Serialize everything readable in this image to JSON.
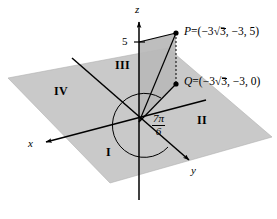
{
  "figure": {
    "type": "3d-coordinate-diagram",
    "background_color": "#ffffff",
    "plane_fill_color": "#c8c8c8",
    "wall_fill_color": "#b4b4b4",
    "line_color": "#000000",
    "axes": [
      {
        "name": "x",
        "label": "x"
      },
      {
        "name": "y",
        "label": "y"
      },
      {
        "name": "z",
        "label": "z"
      }
    ],
    "ticks": [
      {
        "axis": "z",
        "label": "5",
        "value": 5
      }
    ],
    "quadrants": [
      {
        "name": "quadrant-one",
        "label": "I"
      },
      {
        "name": "quadrant-two",
        "label": "II"
      },
      {
        "name": "quadrant-three",
        "label": "III"
      },
      {
        "name": "quadrant-four",
        "label": "IV"
      }
    ],
    "points": [
      {
        "name": "point-p",
        "label_name": "P",
        "equals": "=",
        "open_paren": "(",
        "coord_x_prefix": "−3",
        "coord_x_radical": "3",
        "coord_y": ", −3, ",
        "coord_z": "5",
        "close_paren": ")",
        "full_label": "P = (−3√3, −3, 5)"
      },
      {
        "name": "point-q",
        "label_name": "Q",
        "equals": "=",
        "open_paren": "(",
        "coord_x_prefix": "−3",
        "coord_x_radical": "3",
        "coord_y": ", −3, ",
        "coord_z": "0",
        "close_paren": ")",
        "full_label": "Q = (−3√3, −3, 0)"
      }
    ],
    "angle": {
      "name": "polar-angle",
      "numerator": "7π",
      "denominator": "6",
      "full_label": "7π/6"
    }
  }
}
